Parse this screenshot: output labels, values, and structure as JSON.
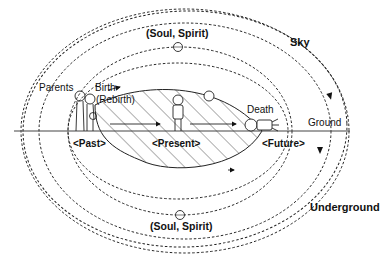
{
  "diagram": {
    "labels": {
      "sky": "Sky",
      "underground": "Underground",
      "ground": "Ground",
      "parents": "Parents",
      "birth": "Birth",
      "rebirth": "(Rebirth)",
      "death": "Death",
      "soul_top": "(Soul, Spirit)",
      "soul_bottom": "(Soul, Spirit)",
      "past": "<Past>",
      "present": "<Present>",
      "future": "<Future>"
    },
    "icons": {
      "parent_figures": "parents-figures",
      "child_figure": "child-figure",
      "person_present": "person-figure",
      "person_dead": "lying-body",
      "soul_circle": "soul-circle"
    },
    "colors": {
      "line": "#222222",
      "background": "#ffffff",
      "hatch": "#333333"
    }
  }
}
